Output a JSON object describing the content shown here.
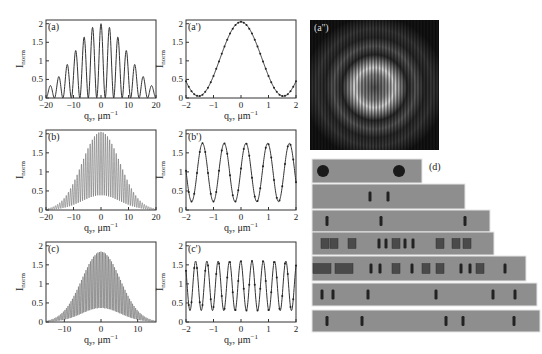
{
  "figure": {
    "panels": [
      {
        "id": "a",
        "label": "(a)",
        "xlabel": "q_y, μm⁻¹",
        "ylabel": "I_norm",
        "xticks": [
          "-20",
          "-10",
          "0",
          "10",
          "20"
        ],
        "yticks": [
          "0",
          "0.5",
          "1",
          "1.5",
          "2"
        ]
      },
      {
        "id": "a_prime",
        "label": "(a')",
        "xlabel": "q_y, μm⁻¹",
        "ylabel": "I_norm",
        "xticks": [
          "-2",
          "-1",
          "0",
          "1",
          "2"
        ],
        "yticks": [
          "0",
          "0.5",
          "1",
          "1.5",
          "2"
        ]
      },
      {
        "id": "b",
        "label": "(b)",
        "xlabel": "q_y, μm⁻¹",
        "ylabel": "I_norm",
        "xticks": [
          "-20",
          "-10",
          "0",
          "10",
          "20"
        ],
        "yticks": [
          "0",
          "0.5",
          "1",
          "1.5",
          "2"
        ]
      },
      {
        "id": "b_prime",
        "label": "(b')",
        "xlabel": "q_y, μm⁻¹",
        "ylabel": "I_norm",
        "xticks": [
          "-2",
          "-1",
          "0",
          "1",
          "2"
        ],
        "yticks": [
          "0",
          "0.5",
          "1",
          "1.5",
          "2"
        ]
      },
      {
        "id": "c",
        "label": "(c)",
        "xlabel": "q_y, μm⁻¹",
        "ylabel": "I_norm",
        "xticks": [
          "-10",
          "0",
          "10"
        ],
        "yticks": [
          "0",
          "0.5",
          "1",
          "1.5",
          "2"
        ]
      },
      {
        "id": "c_prime",
        "label": "(c')",
        "xlabel": "q_y, μm⁻¹",
        "ylabel": "I_norm",
        "xticks": [
          "-2",
          "-1",
          "0",
          "1",
          "2"
        ],
        "yticks": [
          "0",
          "0.5",
          "1",
          "1.5",
          "2"
        ]
      }
    ],
    "image_panels": [
      {
        "id": "a_double_prime",
        "label": "(a'')",
        "description": "2D diffraction pattern: concentric rings with vertical fringes"
      },
      {
        "id": "d",
        "label": "(d)",
        "description": "Seven grey strips with dark apertures (circles, slits, rectangles)"
      }
    ]
  },
  "chart_data": [
    {
      "type": "line",
      "title": "(a)",
      "xlabel": "q_y, μm⁻¹",
      "ylabel": "I_norm",
      "xlim": [
        -20,
        20
      ],
      "ylim": [
        0,
        2.1
      ],
      "series": [
        {
          "name": "two-slit fringes under sinc envelope",
          "peaks_x": [
            -15.5,
            -12.3,
            -9.2,
            -6.1,
            -3.0,
            0,
            3.0,
            6.1,
            9.2,
            12.3,
            15.5
          ],
          "peaks_y": [
            0.18,
            0.45,
            0.92,
            1.45,
            1.8,
            1.97,
            1.8,
            1.45,
            0.9,
            0.45,
            0.18
          ]
        }
      ]
    },
    {
      "type": "line",
      "title": "(a')",
      "xlabel": "q_y, μm⁻¹",
      "ylabel": "I_norm",
      "xlim": [
        -2,
        2
      ],
      "ylim": [
        0,
        2.1
      ],
      "series": [
        {
          "name": "zoom of central peak",
          "x": [
            -2,
            -1.6,
            -1,
            -0.5,
            0,
            0.5,
            1,
            1.6,
            2
          ],
          "y": [
            0.3,
            0.05,
            0.7,
            1.6,
            1.97,
            1.6,
            0.7,
            0.05,
            0.3
          ]
        }
      ]
    },
    {
      "type": "line",
      "title": "(b)",
      "xlabel": "q_y, μm⁻¹",
      "ylabel": "I_norm",
      "xlim": [
        -20,
        20
      ],
      "ylim": [
        0,
        2.1
      ],
      "series": [
        {
          "name": "dense fringes, envelope max",
          "x": [
            -20,
            -15,
            -10,
            -5,
            0,
            5,
            10,
            15,
            20
          ],
          "y": [
            0.03,
            0.25,
            0.75,
            1.45,
            1.85,
            1.45,
            0.75,
            0.25,
            0.03
          ]
        }
      ]
    },
    {
      "type": "line",
      "title": "(b')",
      "xlabel": "q_y, μm⁻¹",
      "ylabel": "I_norm",
      "xlim": [
        -2,
        2
      ],
      "ylim": [
        0,
        2.1
      ],
      "series": [
        {
          "name": "periodic fringes",
          "period": 0.79,
          "max": 1.75,
          "min": 0.22
        }
      ]
    },
    {
      "type": "line",
      "title": "(c)",
      "xlabel": "q_y, μm⁻¹",
      "ylabel": "I_norm",
      "xlim": [
        -15,
        15
      ],
      "ylim": [
        0,
        2.1
      ],
      "series": [
        {
          "name": "dense fringes, envelope max",
          "x": [
            -15,
            -10,
            -5,
            0,
            5,
            10,
            15
          ],
          "y": [
            0.05,
            0.4,
            1.2,
            1.65,
            1.2,
            0.4,
            0.05
          ]
        }
      ]
    },
    {
      "type": "line",
      "title": "(c')",
      "xlabel": "q_y, μm⁻¹",
      "ylabel": "I_norm",
      "xlim": [
        -2,
        2
      ],
      "ylim": [
        0,
        2.1
      ],
      "series": [
        {
          "name": "periodic fringes",
          "period": 0.41,
          "max": 1.6,
          "min": 0.3
        }
      ]
    }
  ]
}
